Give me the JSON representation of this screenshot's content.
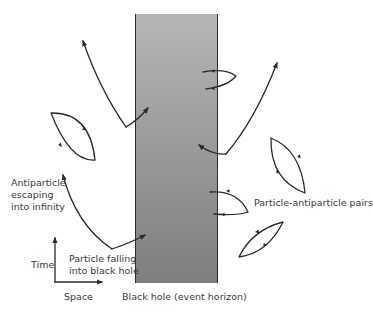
{
  "diagram": {
    "colors": {
      "background": "#ffffff",
      "black_hole_top": "#b4b4b4",
      "black_hole_bottom": "#808080",
      "horizon_edge": "#2a2a2a",
      "ink": "#2a2a2a",
      "label": "#3a3a3a"
    },
    "black_hole": {
      "label": "Black hole (event horizon)"
    },
    "labels": {
      "antiparticle_line1": "Antiparticle",
      "antiparticle_line2": "escaping",
      "antiparticle_line3": "into infinity",
      "particle_line1": "Particle falling",
      "particle_line2": "into black hole",
      "pairs": "Particle-antiparticle pairs",
      "axis_time": "Time",
      "axis_space": "Space"
    },
    "elements": [
      {
        "type": "escaping-pair",
        "side": "left",
        "position": "upper"
      },
      {
        "type": "annihilating-pair",
        "side": "left",
        "position": "middle"
      },
      {
        "type": "escaping-pair",
        "side": "left",
        "position": "lower"
      },
      {
        "type": "straddling-pair",
        "side": "right",
        "position": "upper"
      },
      {
        "type": "escaping-pair",
        "side": "right",
        "position": "middle"
      },
      {
        "type": "annihilating-pair",
        "side": "right",
        "position": "middle"
      },
      {
        "type": "straddling-pair",
        "side": "right",
        "position": "lower"
      },
      {
        "type": "annihilating-pair",
        "side": "right",
        "position": "lower"
      }
    ]
  }
}
